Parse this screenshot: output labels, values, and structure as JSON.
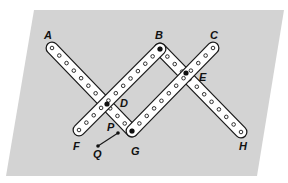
{
  "figure": {
    "background_color": "#d3d3d3",
    "bar_fill": "#ffffff",
    "bar_stroke": "#1a1a1a",
    "background_polygon": [
      [
        34,
        10
      ],
      [
        284,
        10
      ],
      [
        257,
        176
      ],
      [
        6,
        176
      ]
    ]
  },
  "points": {
    "A": {
      "x": 52,
      "y": 48,
      "label": "A",
      "label_x": 44,
      "label_y": 39
    },
    "B": {
      "x": 160,
      "y": 49,
      "label": "B",
      "label_x": 155,
      "label_y": 39
    },
    "C": {
      "x": 213,
      "y": 48,
      "label": "C",
      "label_x": 210,
      "label_y": 39
    },
    "D": {
      "x": 107,
      "y": 104,
      "label": "D",
      "label_x": 120,
      "label_y": 107
    },
    "E": {
      "x": 186,
      "y": 73,
      "label": "E",
      "label_x": 199,
      "label_y": 81
    },
    "F": {
      "x": 79,
      "y": 130,
      "label": "F",
      "label_x": 73,
      "label_y": 150
    },
    "G": {
      "x": 132,
      "y": 131,
      "label": "G",
      "label_x": 131,
      "label_y": 155
    },
    "H": {
      "x": 241,
      "y": 132,
      "label": "H",
      "label_x": 239,
      "label_y": 150
    },
    "P": {
      "x": 118,
      "y": 133,
      "label": "P",
      "label_x": 107,
      "label_y": 131
    },
    "Q": {
      "x": 98,
      "y": 146,
      "label": "Q",
      "label_x": 93,
      "label_y": 158
    }
  },
  "bars": [
    {
      "name": "bar-A-G",
      "from": "A",
      "to": "G",
      "holes": 12
    },
    {
      "name": "bar-B-H",
      "from": "B",
      "to": "H",
      "holes": 12
    },
    {
      "name": "bar-F-B",
      "from": "F",
      "to": "B",
      "holes": 12
    },
    {
      "name": "bar-G-C",
      "from": "G",
      "to": "C",
      "holes": 12
    }
  ],
  "pivots": [
    "B",
    "D",
    "E",
    "G"
  ],
  "segment_PQ": {
    "from": "P",
    "to": "Q"
  }
}
